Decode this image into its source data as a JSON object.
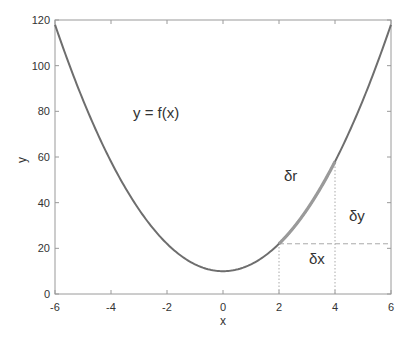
{
  "chart_data": {
    "type": "line",
    "title": "",
    "xlabel": "x",
    "ylabel": "y",
    "xlim": [
      -6,
      6
    ],
    "ylim": [
      0,
      120
    ],
    "xticks": [
      -6,
      -4,
      -2,
      0,
      2,
      4,
      6
    ],
    "yticks": [
      0,
      20,
      40,
      60,
      80,
      100,
      120
    ],
    "grid": false,
    "legend": null,
    "series": [
      {
        "name": "y = f(x)",
        "function": "3x^2 + 10",
        "x": [
          -6,
          -5,
          -4,
          -3,
          -2,
          -1,
          0,
          1,
          2,
          3,
          4,
          5,
          6
        ],
        "values": [
          118,
          85,
          58,
          37,
          22,
          13,
          10,
          13,
          22,
          37,
          58,
          85,
          118
        ],
        "color": "#6e6e6e"
      },
      {
        "name": "δr segment",
        "x": [
          2,
          3,
          4
        ],
        "values": [
          22,
          37,
          58
        ],
        "color": "#9a9a9a"
      }
    ],
    "annotations": [
      {
        "text": "y = f(x)",
        "x": -1.9,
        "y": 76
      },
      {
        "text": "δr",
        "x": 2.2,
        "y": 52
      },
      {
        "text": "δy",
        "x": 4.3,
        "y": 34
      },
      {
        "text": "δx",
        "x": 2.8,
        "y": 15
      }
    ],
    "guides": [
      {
        "type": "dashed",
        "from": [
          2,
          22
        ],
        "to": [
          4,
          22
        ]
      },
      {
        "type": "dashed",
        "from": [
          4,
          22
        ],
        "to": [
          6,
          22
        ]
      },
      {
        "type": "dotted",
        "from": [
          2,
          0
        ],
        "to": [
          2,
          22
        ]
      },
      {
        "type": "dotted",
        "from": [
          4,
          0
        ],
        "to": [
          4,
          58
        ]
      }
    ]
  },
  "labels": {
    "equation": "y = f(x)",
    "delta_r": "δr",
    "delta_y": "δy",
    "delta_x": "δx",
    "xlabel": "x",
    "ylabel": "y"
  }
}
